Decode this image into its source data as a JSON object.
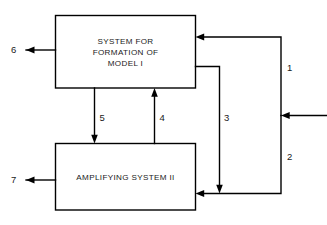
{
  "diagram": {
    "background_color": "#ffffff",
    "line_color": "#000000",
    "text_color": "#1a1a1a",
    "blocks": [
      {
        "id": "block_i",
        "name": "system-for-formation-of-model-i",
        "lines": [
          "SYSTEM FOR",
          "FORMATION OF",
          "MODEL I"
        ],
        "line1": "SYSTEM FOR",
        "line2": "FORMATION OF",
        "line3": "MODEL I"
      },
      {
        "id": "block_ii",
        "name": "amplifying-system-ii",
        "lines": [
          "AMPLIFYING SYSTEM II"
        ],
        "line1": "AMPLIFYING SYSTEM II"
      }
    ],
    "signals": [
      {
        "id": "s1",
        "label": "1",
        "description": "input feedback path to system for formation of model I"
      },
      {
        "id": "s2",
        "label": "2",
        "description": "external input to right bus"
      },
      {
        "id": "s3",
        "label": "3",
        "description": "path from model I block down to amplifying system II"
      },
      {
        "id": "s4",
        "label": "4",
        "description": "feedback from amplifying system II up to model I"
      },
      {
        "id": "s5",
        "label": "5",
        "description": "path from model I down to amplifying system II"
      },
      {
        "id": "s6",
        "label": "6",
        "description": "output of system for formation of model I"
      },
      {
        "id": "s7",
        "label": "7",
        "description": "output of amplifying system II"
      }
    ],
    "labels": {
      "one": "1",
      "two": "2",
      "three": "3",
      "four": "4",
      "five": "5",
      "six": "6",
      "seven": "7"
    }
  }
}
